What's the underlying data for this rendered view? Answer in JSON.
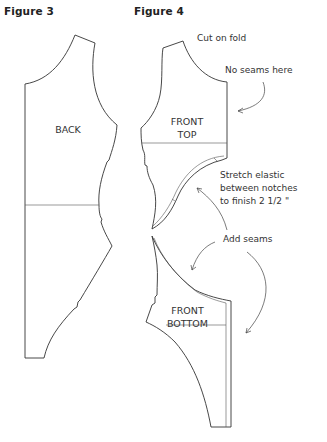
{
  "figures": {
    "figure3": {
      "title": "Figure 3",
      "piece_label": "BACK"
    },
    "figure4": {
      "title": "Figure 4",
      "pieces": {
        "front_top": "FRONT\nTOP",
        "front_top_l1": "FRONT",
        "front_top_l2": "TOP",
        "front_bottom_l1": "FRONT",
        "front_bottom_l2": "BOTTOM"
      },
      "annotations": {
        "cut_on_fold": "Cut on fold",
        "no_seams": "No seams here",
        "elastic_l1": "Stretch elastic",
        "elastic_l2": "between notches",
        "elastic_l3": "to finish 2 1/2 \"",
        "add_seams": "Add seams"
      }
    }
  },
  "colors": {
    "line": "#333333",
    "background": "#ffffff"
  }
}
